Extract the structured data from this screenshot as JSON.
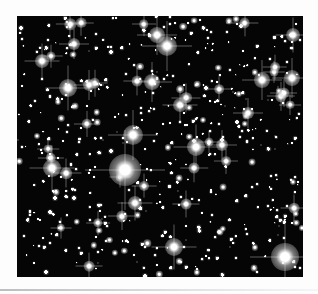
{
  "image": {
    "subject": "Dense star field photograph",
    "background_color": "#050505",
    "frame": {
      "x": 17,
      "y": 16,
      "width": 286,
      "height": 261
    },
    "bright_stars": [
      {
        "x": 108,
        "y": 154,
        "r": 16
      },
      {
        "x": 268,
        "y": 241,
        "r": 14
      },
      {
        "x": 116,
        "y": 119,
        "r": 10
      },
      {
        "x": 150,
        "y": 30,
        "r": 10
      },
      {
        "x": 140,
        "y": 19,
        "r": 8
      },
      {
        "x": 51,
        "y": 72,
        "r": 9
      },
      {
        "x": 135,
        "y": 66,
        "r": 8
      },
      {
        "x": 179,
        "y": 131,
        "r": 9
      },
      {
        "x": 163,
        "y": 89,
        "r": 7
      },
      {
        "x": 245,
        "y": 64,
        "r": 8
      },
      {
        "x": 275,
        "y": 62,
        "r": 8
      },
      {
        "x": 157,
        "y": 231,
        "r": 9
      },
      {
        "x": 35,
        "y": 152,
        "r": 9
      },
      {
        "x": 276,
        "y": 19,
        "r": 7
      },
      {
        "x": 72,
        "y": 69,
        "r": 6
      },
      {
        "x": 205,
        "y": 129,
        "r": 6
      },
      {
        "x": 25,
        "y": 45,
        "r": 7
      },
      {
        "x": 118,
        "y": 187,
        "r": 7
      },
      {
        "x": 231,
        "y": 97,
        "r": 6
      },
      {
        "x": 57,
        "y": 28,
        "r": 6
      }
    ]
  }
}
